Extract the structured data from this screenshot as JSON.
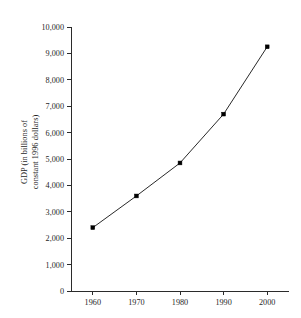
{
  "chart_data": {
    "type": "line",
    "title": "",
    "xlabel": "",
    "ylabel": "GDP (in billions of constant 1996 dollars)",
    "ylabel_line1": "GDP (in billions of",
    "ylabel_line2": "constant 1996 dollars)",
    "categories": [
      "1960",
      "1970",
      "1980",
      "1990",
      "2000"
    ],
    "x": [
      1960,
      1970,
      1980,
      1990,
      2000
    ],
    "values": [
      2400,
      3600,
      4850,
      6700,
      9250
    ],
    "series": [
      {
        "name": "GDP",
        "values": [
          2400,
          3600,
          4850,
          6700,
          9250
        ]
      }
    ],
    "xlim": [
      1955,
      2005
    ],
    "ylim": [
      0,
      10000
    ],
    "ytick_labels": [
      "10,000",
      "9,000",
      "8,000",
      "7,000",
      "6,000",
      "5,000",
      "4,000",
      "3,000",
      "2,000",
      "1,000",
      "0"
    ],
    "ytick_values": [
      10000,
      9000,
      8000,
      7000,
      6000,
      5000,
      4000,
      3000,
      2000,
      1000,
      0
    ],
    "xtick_labels": [
      "1960",
      "1970",
      "1980",
      "1990",
      "2000"
    ],
    "xtick_values": [
      1960,
      1970,
      1980,
      1990,
      2000
    ],
    "grid": false,
    "legend": false,
    "legend_position": "none",
    "marker": "square",
    "line_color": "#111111",
    "marker_color": "#000000",
    "axis_color": "#2b2b2b",
    "background_color": "#ffffff",
    "annotations": []
  }
}
